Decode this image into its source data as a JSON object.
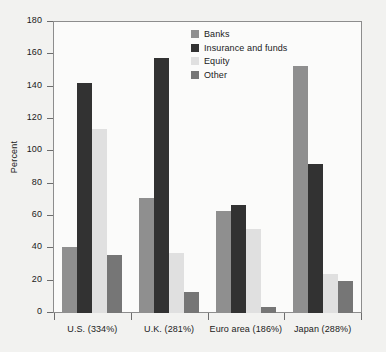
{
  "chart_data": {
    "type": "bar",
    "title": "",
    "xlabel": "",
    "ylabel": "Percent",
    "ylim": [
      0,
      180
    ],
    "ytick_step": 20,
    "yticks": [
      180,
      160,
      140,
      120,
      100,
      80,
      60,
      40,
      20,
      0
    ],
    "grid": false,
    "legend_position": "top-center",
    "categories": [
      "U.S. (334%)",
      "U.K. (281%)",
      "Euro area (186%)",
      "Japan (288%)"
    ],
    "series": [
      {
        "name": "Banks",
        "color": "#8f8f8f",
        "values": [
          41,
          71,
          63,
          153
        ]
      },
      {
        "name": "Insurance and funds",
        "color": "#323232",
        "values": [
          142,
          158,
          67,
          92
        ]
      },
      {
        "name": "Equity",
        "color": "#e0e0e0",
        "values": [
          114,
          37,
          52,
          24
        ]
      },
      {
        "name": "Other",
        "color": "#767676",
        "values": [
          36,
          13,
          4,
          20
        ]
      }
    ]
  }
}
